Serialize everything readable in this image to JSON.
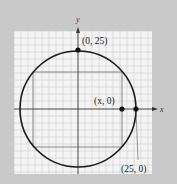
{
  "figure": {
    "background": "#c9c9c9",
    "grid_background": "#f4f4f4",
    "grid_line_color": "#c8c8c8",
    "axis_color": "#333333",
    "circle_color": "#1a1a1a",
    "rectangle_color": "#7a7a7a",
    "axes": {
      "x_label": "x",
      "y_label": "y"
    },
    "points": [
      {
        "label": "(0, 25)",
        "x": 0,
        "y": 25
      },
      {
        "label": "(x, 0)",
        "x": "x",
        "y": 0
      },
      {
        "label": "(25, 0)",
        "x": 25,
        "y": 0
      }
    ],
    "circle": {
      "center": [
        0,
        0
      ],
      "radius": 25
    },
    "rectangle": {
      "description": "rectangle inscribed in circle, right side through (x, 0)"
    }
  }
}
